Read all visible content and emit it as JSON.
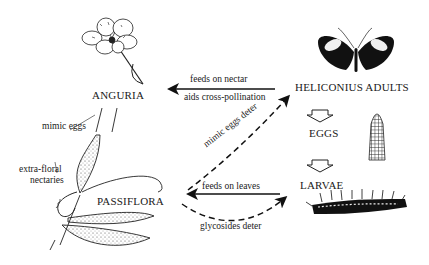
{
  "diagram": {
    "type": "ecological-interaction",
    "nodes": {
      "anguria": "ANGURIA",
      "passiflora": "PASSIFLORA",
      "heliconius_adults": "HELICONIUS ADULTS",
      "eggs": "EGGS",
      "larvae": "LARVAE"
    },
    "edges": {
      "adult_to_anguria_top": "feeds on nectar",
      "adult_to_anguria_bottom": "aids cross-pollination",
      "larvae_to_passiflora": "feeds on leaves",
      "passiflora_mimic": "mimic eggs deter",
      "passiflora_glycosides": "glycosides deter"
    },
    "annotations": {
      "mimic_eggs": "mimic eggs",
      "extra_floral_nectaries_1": "extra-floral",
      "extra_floral_nectaries_2": "nectaries"
    },
    "illustrations": [
      "anguria-flower",
      "heliconius-butterfly",
      "egg",
      "caterpillar",
      "passiflora-vine"
    ]
  }
}
